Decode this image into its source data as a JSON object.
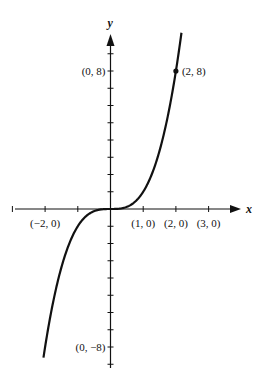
{
  "chart_data": {
    "type": "line",
    "title": "",
    "function": "y = x^3",
    "xlabel": "x",
    "ylabel": "y",
    "xlim": [
      -3,
      4
    ],
    "ylim": [
      -9.5,
      10.5
    ],
    "x_ticks": [
      -3,
      -2,
      -1,
      1,
      2,
      3
    ],
    "y_ticks": [
      -9,
      -8,
      -7,
      -6,
      -5,
      -4,
      -3,
      -2,
      -1,
      1,
      2,
      3,
      4,
      5,
      6,
      7,
      8,
      9
    ],
    "curve_x_range": [
      -2.05,
      2.17
    ],
    "series": [
      {
        "name": "y = x^3",
        "x": [
          -2.05,
          -1.5,
          -1,
          -0.5,
          0,
          0.5,
          1,
          1.5,
          2,
          2.17
        ],
        "y": [
          -8.615,
          -3.375,
          -1,
          -0.125,
          0,
          0.125,
          1,
          3.375,
          8,
          10.22
        ]
      }
    ],
    "annotations": [
      {
        "text": "(0, 8)",
        "x": 0,
        "y": 8,
        "side": "left"
      },
      {
        "text": "(2, 8)",
        "x": 2,
        "y": 8,
        "side": "right",
        "marker": true
      },
      {
        "text": "(0, −8)",
        "x": 0,
        "y": -8,
        "side": "left"
      },
      {
        "text": "(−2, 0)",
        "x": -2,
        "y": 0,
        "side": "below"
      },
      {
        "text": "(1, 0)",
        "x": 1,
        "y": 0,
        "side": "below"
      },
      {
        "text": "(2, 0)",
        "x": 2,
        "y": 0,
        "side": "below"
      },
      {
        "text": "(3, 0)",
        "x": 3,
        "y": 0,
        "side": "below"
      }
    ],
    "grid": false,
    "legend": "none"
  }
}
